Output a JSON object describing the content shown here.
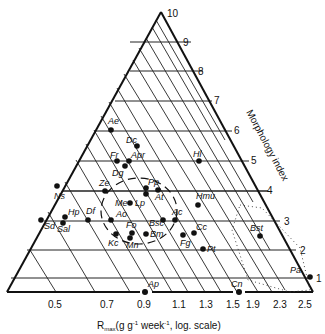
{
  "diagram": {
    "type": "ternary-like triangular plot",
    "x_axis_label": "R",
    "x_axis_label_sub": "max",
    "x_axis_label_rest": "(g g",
    "x_axis_sup1": "-1",
    "x_axis_label_mid": " week",
    "x_axis_sup2": "-1",
    "x_axis_label_end": ", log. scale)",
    "right_axis_label": "Morphology index",
    "x_ticks": [
      "0.5",
      "0.7",
      "0.9",
      "1.1",
      "1.3",
      "1.5",
      "1.9",
      "2.3",
      "2.5"
    ],
    "right_ticks": [
      "10",
      "9",
      "8",
      "7",
      "6",
      "5",
      "4",
      "3",
      "2",
      "1"
    ],
    "points": [
      {
        "label": "Ae",
        "x": 111,
        "y": 130
      },
      {
        "label": "Dc",
        "x": 137,
        "y": 146
      },
      {
        "label": "Fr",
        "x": 117,
        "y": 161
      },
      {
        "label": "Apr",
        "x": 129,
        "y": 161
      },
      {
        "label": "Dg",
        "x": 125,
        "y": 166
      },
      {
        "label": "Ze",
        "x": 105,
        "y": 191
      },
      {
        "label": "Pp",
        "x": 146,
        "y": 188
      },
      {
        "label": "At",
        "x": 158,
        "y": 190
      },
      {
        "label": "Lp",
        "x": 130,
        "y": 203
      },
      {
        "label": "Me",
        "x": 130,
        "y": 203
      },
      {
        "label": "Ns",
        "x": 57,
        "y": 186
      },
      {
        "label": "Hp",
        "x": 65,
        "y": 217
      },
      {
        "label": "Sal",
        "x": 63,
        "y": 223
      },
      {
        "label": "Sd",
        "x": 41,
        "y": 220
      },
      {
        "label": "Df",
        "x": 88,
        "y": 220
      },
      {
        "label": "Ao",
        "x": 111,
        "y": 220
      },
      {
        "label": "Bsc",
        "x": 163,
        "y": 220
      },
      {
        "label": "Ac",
        "x": 175,
        "y": 220
      },
      {
        "label": "Kc",
        "x": 116,
        "y": 234
      },
      {
        "label": "Fo",
        "x": 132,
        "y": 233
      },
      {
        "label": "Mn",
        "x": 130,
        "y": 238
      },
      {
        "label": "Bm",
        "x": 146,
        "y": 234
      },
      {
        "label": "Fg",
        "x": 183,
        "y": 235
      },
      {
        "label": "Cc",
        "x": 194,
        "y": 233
      },
      {
        "label": "Pt",
        "x": 203,
        "y": 249
      },
      {
        "label": "Hl",
        "x": 199,
        "y": 161
      },
      {
        "label": "Hmu",
        "x": 198,
        "y": 205
      },
      {
        "label": "Bst",
        "x": 260,
        "y": 236
      },
      {
        "label": "Pa",
        "x": 310,
        "y": 277
      },
      {
        "label": "Ap",
        "x": 145,
        "y": 292
      },
      {
        "label": "Cn",
        "x": 239,
        "y": 292
      }
    ]
  }
}
